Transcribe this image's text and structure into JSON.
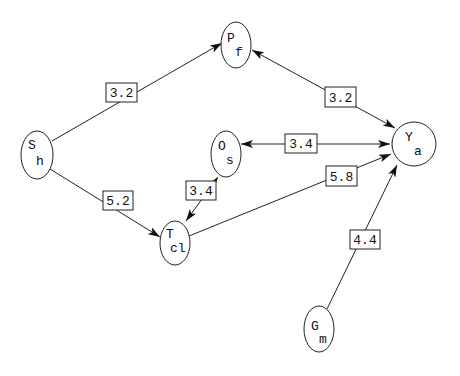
{
  "diagram": {
    "type": "directed-graph",
    "nodes": [
      {
        "id": "Sh",
        "main": "S",
        "sub": "h"
      },
      {
        "id": "Pf",
        "main": "P",
        "sub": "f"
      },
      {
        "id": "Os",
        "main": "O",
        "sub": "s"
      },
      {
        "id": "Ya",
        "main": "Y",
        "sub": "a"
      },
      {
        "id": "Tcl",
        "main": "T",
        "sub": "cl"
      },
      {
        "id": "Gm",
        "main": "G",
        "sub": "m"
      }
    ],
    "edges": [
      {
        "from": "Sh",
        "to": "Pf",
        "label": "3.2",
        "direction": "forward"
      },
      {
        "from": "Pf",
        "to": "Ya",
        "label": "3.2",
        "direction": "both"
      },
      {
        "from": "Os",
        "to": "Ya",
        "label": "3.4",
        "direction": "both"
      },
      {
        "from": "Sh",
        "to": "Tcl",
        "label": "5.2",
        "direction": "forward"
      },
      {
        "from": "Tcl",
        "to": "Os",
        "label": "3.4",
        "direction": "both"
      },
      {
        "from": "Tcl",
        "to": "Ya",
        "label": "5.8",
        "direction": "forward"
      },
      {
        "from": "Gm",
        "to": "Ya",
        "label": "4.4",
        "direction": "forward"
      }
    ]
  }
}
